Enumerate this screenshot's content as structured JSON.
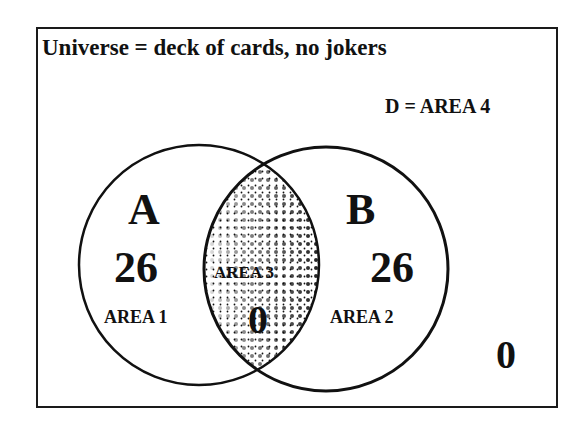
{
  "title": "Universe = deck of cards, no jokers",
  "region_d_label": "D = AREA 4",
  "sets": {
    "a": {
      "name": "A",
      "count": "26",
      "area_label": "AREA 1"
    },
    "b": {
      "name": "B",
      "count": "26",
      "area_label": "AREA 2"
    },
    "intersection": {
      "area_label": "AREA 3",
      "count": "0"
    },
    "outside": {
      "count": "0"
    }
  },
  "colors": {
    "stroke": "#111111",
    "background": "#ffffff",
    "dots": "#111111"
  }
}
